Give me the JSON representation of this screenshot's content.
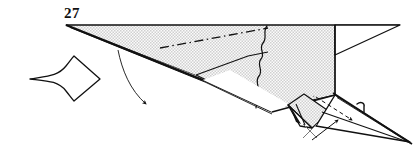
{
  "figure": {
    "kind": "origami-folding-diagram",
    "step_number": "27",
    "background_color": "#ffffff",
    "ink_color": "#111111",
    "paper_fill_color": "#f0f0f0",
    "paper_dot_color": "#b9b9b9",
    "white_face_color": "#ffffff"
  },
  "labels": {
    "step_number": "27"
  },
  "symbols": [
    {
      "name": "push-in-arrow",
      "description": "hollow concave arrow pointing right at left of figure",
      "position": {
        "x": 30,
        "y": 62,
        "width": 72,
        "height": 36
      }
    },
    {
      "name": "fold-direction-arrow",
      "description": "thin curved arrow from upper-left edge curving down to the right with solid arrowhead",
      "position": {
        "x": 116,
        "y": 50,
        "width": 46,
        "height": 58
      }
    },
    {
      "name": "tuck-arrow",
      "description": "dashed arrow inside pointed tail indicating hidden tuck fold",
      "position": {
        "x": 314,
        "y": 96,
        "width": 44,
        "height": 32
      }
    },
    {
      "name": "insert-arrow",
      "description": "small solid arrow pointing up-right beneath the tail",
      "position": {
        "x": 314,
        "y": 118,
        "width": 30,
        "height": 24
      }
    },
    {
      "name": "x-cross-mark",
      "description": "small crossed tick mark below the tail",
      "position": {
        "x": 306,
        "y": 124,
        "width": 16,
        "height": 16
      }
    },
    {
      "name": "hook-mark",
      "description": "small hook / barb mark at top of the pointed tail",
      "position": {
        "x": 356,
        "y": 103,
        "width": 12,
        "height": 10
      }
    }
  ],
  "fold_lines": [
    {
      "name": "dash-dot-fold-line",
      "style": "dash-dot",
      "description": "long diagonal crease across the shaded top panel"
    },
    {
      "name": "wavy-edge-line",
      "style": "irregular",
      "description": "vertical wavy torn edge in the middle-right of the shaded panel"
    }
  ],
  "shapes": [
    {
      "name": "main-shaded-panel",
      "fill": "paper",
      "description": "large shaded quadrilateral forming the body"
    },
    {
      "name": "right-tail-triangle",
      "fill": "white",
      "description": "thin white triangle tail at far right"
    },
    {
      "name": "lower-white-wedge",
      "fill": "white",
      "description": "white wedge below the main body"
    },
    {
      "name": "bottom-flap",
      "fill": "paper",
      "description": "small shaded flap folded under at bottom right"
    },
    {
      "name": "pointed-spike",
      "fill": "white",
      "description": "long narrow spike extending to lower-right corner"
    }
  ]
}
